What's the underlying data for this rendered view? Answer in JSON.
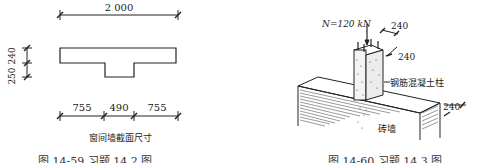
{
  "left_figure": {
    "top_dimension": "2 000",
    "left_dimensions": [
      "240",
      "250"
    ],
    "left_dimensions_label": "250 240",
    "bottom_dimensions": [
      "755",
      "490",
      "755"
    ],
    "subtitle": "窗间墙截面尺寸",
    "caption": "图 14-59   习题 14.2 图"
  },
  "right_figure": {
    "load_label": "N=120 kN",
    "column_dim_1": "240",
    "column_dim_2": "240",
    "column_label": "钢筋混凝土柱",
    "wall_dim": "240",
    "wall_label": "砖墙",
    "caption": "图 14-60   习题 14.3 图"
  }
}
